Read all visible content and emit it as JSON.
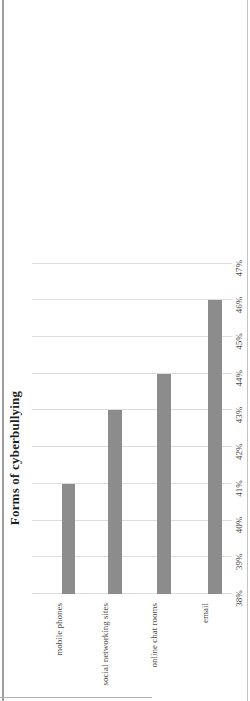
{
  "chart_data": {
    "type": "bar",
    "title": "Forms of cyberbullying",
    "categories": [
      "mobile phones",
      "social networking sites",
      "online chat rooms",
      "email"
    ],
    "values": [
      41,
      43,
      44,
      46
    ],
    "unit": "%",
    "series_name": "",
    "xlabel": "",
    "ylabel": "",
    "axis": {
      "min": 38,
      "max": 47,
      "step": 1,
      "tick_labels": [
        "38%",
        "39%",
        "40%",
        "41%",
        "42%",
        "43%",
        "44%",
        "45%",
        "46%",
        "47%"
      ]
    },
    "grid": true,
    "legend": false,
    "bar_color": "#8c8c8c",
    "gridline_color": "#dcdcdc",
    "orientation": "horizontal-bars",
    "page_rotation": "chart rendered rotated 90deg counter-clockwise on page"
  }
}
